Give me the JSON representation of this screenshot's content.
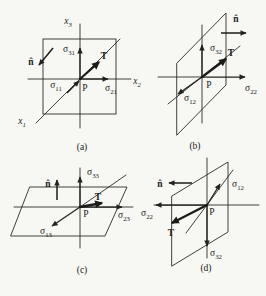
{
  "page": {
    "background": "#f7f7f4",
    "ink": "#1b1b19"
  },
  "figures": {
    "a": {
      "caption": "(a)",
      "labels": {
        "x3": {
          "base": "x",
          "sub": "3"
        },
        "x2": {
          "base": "x",
          "sub": "2"
        },
        "x1": {
          "base": "x",
          "sub": "1"
        },
        "n_hat": "n̂",
        "sigma_31": {
          "base": "σ",
          "sub": "31"
        },
        "sigma_11": {
          "base": "σ",
          "sub": "11"
        },
        "sigma_21": {
          "base": "σ",
          "sub": "21"
        },
        "traction": "T",
        "point": "P"
      }
    },
    "b": {
      "caption": "(b)",
      "labels": {
        "n_hat": "n̂",
        "sigma_32": {
          "base": "σ",
          "sub": "32"
        },
        "sigma_12": {
          "base": "σ",
          "sub": "12"
        },
        "sigma_22": {
          "base": "σ",
          "sub": "22"
        },
        "traction": "T",
        "point": "P"
      }
    },
    "c": {
      "caption": "(c)",
      "labels": {
        "n_hat": "n̂",
        "sigma_33": {
          "base": "σ",
          "sub": "33"
        },
        "sigma_13": {
          "base": "σ",
          "sub": "13"
        },
        "sigma_23": {
          "base": "σ",
          "sub": "23"
        },
        "traction": "T",
        "point": "P"
      }
    },
    "d": {
      "caption": "(d)",
      "labels": {
        "n_hat": "n̂",
        "sigma_12": {
          "base": "σ",
          "sub": "12"
        },
        "sigma_22": {
          "base": "σ",
          "sub": "22"
        },
        "sigma_32": {
          "base": "σ",
          "sub": "32"
        },
        "traction": "T",
        "point": "P"
      }
    }
  }
}
